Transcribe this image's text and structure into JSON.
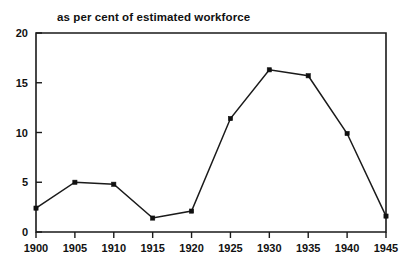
{
  "chart_data": {
    "type": "line",
    "title": "as per cent of estimated workforce",
    "xlabel": "",
    "ylabel": "",
    "x": [
      1900,
      1905,
      1910,
      1915,
      1920,
      1925,
      1930,
      1935,
      1940,
      1945
    ],
    "values": [
      2.4,
      5.0,
      4.8,
      1.4,
      2.1,
      11.4,
      16.3,
      15.7,
      9.9,
      1.6
    ],
    "xticklabels": [
      "1900",
      "1905",
      "1910",
      "1915",
      "1920",
      "1925",
      "1930",
      "1935",
      "1940",
      "1945"
    ],
    "yticklabels": [
      "0",
      "5",
      "10",
      "15",
      "20"
    ],
    "yticks": [
      0,
      5,
      10,
      15,
      20
    ],
    "xlim": [
      1900,
      1945
    ],
    "ylim": [
      0,
      20
    ],
    "grid": false,
    "legend": null,
    "marker": "square",
    "line_color": "#1a1a1a",
    "marker_color": "#101010",
    "background_color": "#ffffff"
  }
}
